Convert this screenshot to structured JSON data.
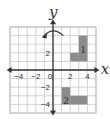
{
  "figure": {
    "grid": {
      "x_min": -5,
      "x_max": 5,
      "y_min": -5,
      "y_max": 5,
      "step": 1,
      "line_color": "#c8c8c8",
      "border_color": "#bdbdbd"
    },
    "axes": {
      "x_label": "x",
      "y_label": "y",
      "color": "#333333",
      "x_ticks": [
        {
          "value": -4,
          "label": "−4"
        },
        {
          "value": -2,
          "label": "−2"
        },
        {
          "value": 0,
          "label": "0"
        },
        {
          "value": 2,
          "label": "2"
        },
        {
          "value": 4,
          "label": "4"
        }
      ],
      "y_ticks": [
        {
          "value": 2,
          "label": "2"
        },
        {
          "value": -2,
          "label": "−2"
        },
        {
          "value": -4,
          "label": "−4"
        }
      ]
    },
    "shapes": [
      {
        "label": "1",
        "fill": "#8c8c8c",
        "cells": [
          [
            3,
            1,
            4,
            4
          ],
          [
            2,
            1,
            3,
            2
          ]
        ],
        "label_pos": [
          3.5,
          2.5
        ]
      },
      {
        "label": "2",
        "fill": "#8c8c8c",
        "cells": [
          [
            1,
            -4,
            2,
            -2
          ],
          [
            2,
            -4,
            4,
            -3
          ]
        ],
        "label_pos": [
          1.5,
          -3.5
        ]
      }
    ],
    "rotation_arrow": {
      "direction": "counterclockwise",
      "color": "#333333"
    }
  }
}
